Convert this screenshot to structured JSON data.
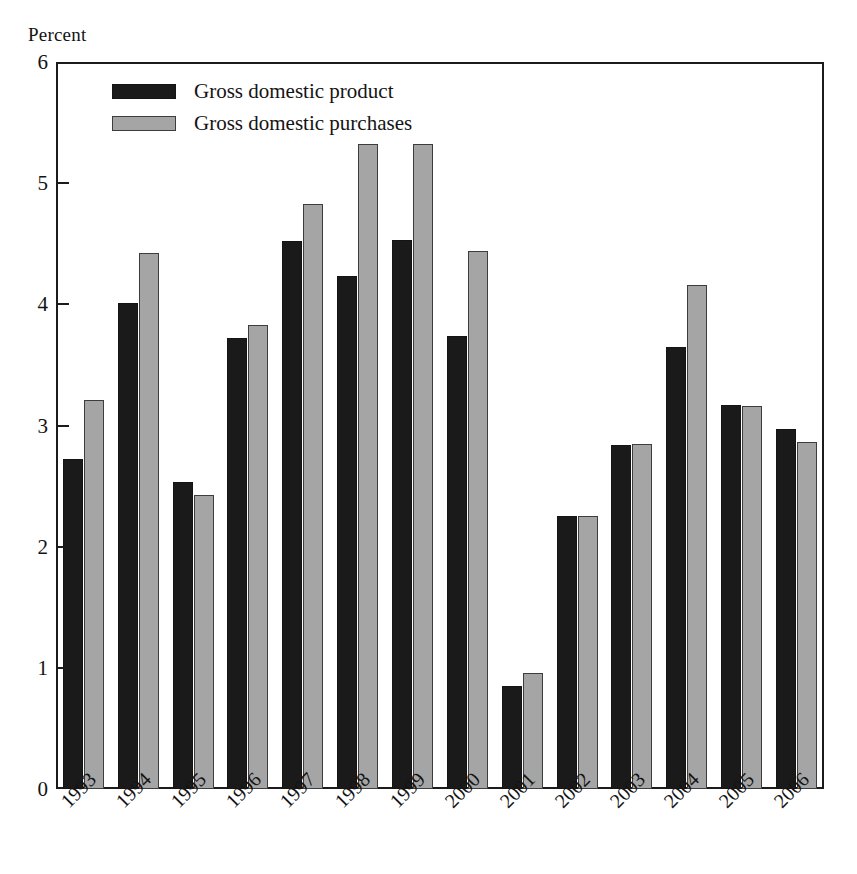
{
  "chart_data": {
    "type": "bar",
    "title": "",
    "subtitle": "",
    "xlabel": "",
    "ylabel": "Percent",
    "ylim": [
      0,
      6
    ],
    "y_ticks": [
      "0",
      "1",
      "2",
      "3",
      "4",
      "5",
      "6"
    ],
    "grid": false,
    "legend_position": "top-left",
    "categories": [
      "1993",
      "1994",
      "1995",
      "1996",
      "1997",
      "1998",
      "1999",
      "2000",
      "2001",
      "2002",
      "2003",
      "2004",
      "2005",
      "2006"
    ],
    "series": [
      {
        "name": "Gross domestic product",
        "color": "#1a1a1a",
        "values": [
          2.72,
          4.01,
          2.53,
          3.72,
          4.52,
          4.23,
          4.53,
          3.74,
          0.85,
          2.25,
          2.84,
          3.65,
          3.17,
          2.97
        ]
      },
      {
        "name": "Gross domestic purchases",
        "color": "#a5a5a5",
        "values": [
          3.21,
          4.42,
          2.43,
          3.83,
          4.83,
          5.32,
          5.32,
          4.44,
          0.96,
          2.25,
          2.85,
          4.16,
          3.16,
          2.86
        ]
      }
    ]
  },
  "axis": {
    "unit_label": "Percent"
  },
  "legend": {
    "items": [
      {
        "label": "Gross domestic product",
        "swatch": "gdp"
      },
      {
        "label": "Gross domestic purchases",
        "swatch": "purch"
      }
    ]
  }
}
